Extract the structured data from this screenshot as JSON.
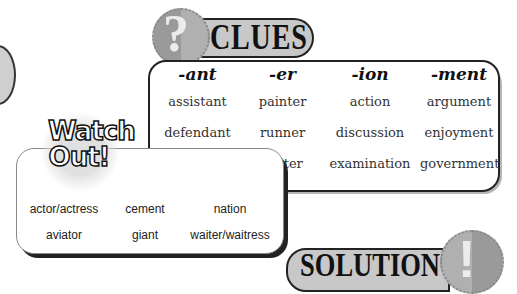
{
  "clues": {
    "title": "CLUES",
    "badge_glyph": "?",
    "columns": [
      {
        "header": "-ant",
        "words": [
          "assistant",
          "defendant",
          "servant"
        ]
      },
      {
        "header": "-er",
        "words": [
          "painter",
          "runner",
          "writer"
        ]
      },
      {
        "header": "-ion",
        "words": [
          "action",
          "discussion",
          "examination"
        ]
      },
      {
        "header": "-ment",
        "words": [
          "argument",
          "enjoyment",
          "government"
        ]
      }
    ]
  },
  "watch_out": {
    "title_line1": "Watch",
    "title_line2": "Out!",
    "rows": [
      [
        "actor/actress",
        "cement",
        "nation"
      ],
      [
        "aviator",
        "giant",
        "waiter/waitress"
      ]
    ]
  },
  "solution": {
    "title": "SOLUTION",
    "badge_glyph": "!"
  }
}
